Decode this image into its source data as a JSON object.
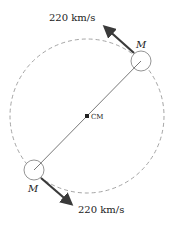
{
  "diagram": {
    "title": "",
    "orbit": {
      "style": "dashed",
      "color": "#9a9a9a"
    },
    "center_of_mass": {
      "label": "CM"
    },
    "masses": [
      {
        "label": "M",
        "position": "upper-right",
        "velocity_label": "220 km/s"
      },
      {
        "label": "M",
        "position": "lower-left",
        "velocity_label": "220 km/s"
      }
    ],
    "colors": {
      "arrow": "#3a3a3a",
      "line": "#555555",
      "mass_outline": "#888888"
    }
  }
}
